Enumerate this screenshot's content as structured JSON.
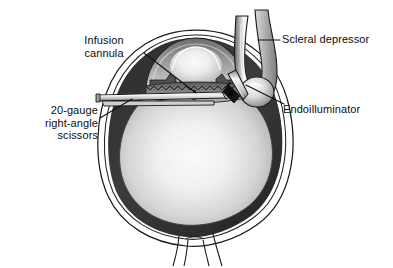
{
  "figure": {
    "background_color": "#ffffff",
    "ink_color": "#111111",
    "dark_tissue_color": "#3a3a3a",
    "mid_tissue_color": "#8d8d8d",
    "light_tissue_color": "#f2f2f2",
    "sclera_color": "#ffffff",
    "leader_line_color": "#111111"
  },
  "labels": [
    {
      "id": "infusion-cannula",
      "lines": "Infusion\ncannula",
      "align": "center",
      "anchor_side": "top-left"
    },
    {
      "id": "scissors",
      "lines": "20-gauge\nright-angle\nscissors",
      "align": "right",
      "anchor_side": "left"
    },
    {
      "id": "scleral-depressor",
      "lines": "Scleral depressor",
      "align": "left",
      "anchor_side": "top-right"
    },
    {
      "id": "endoilluminator",
      "lines": "Endoilluminator",
      "align": "left",
      "anchor_side": "right"
    }
  ],
  "anatomy": [
    {
      "id": "sclera",
      "name": "Sclera"
    },
    {
      "id": "choroid-retina",
      "name": "Choroid and retina"
    },
    {
      "id": "vitreous-cavity",
      "name": "Vitreous cavity"
    },
    {
      "id": "cornea",
      "name": "Cornea"
    },
    {
      "id": "lens",
      "name": "Crystalline lens"
    },
    {
      "id": "iris",
      "name": "Iris"
    },
    {
      "id": "ciliary-body",
      "name": "Ciliary body"
    },
    {
      "id": "optic-nerve",
      "name": "Optic nerve"
    }
  ],
  "instruments": [
    {
      "id": "infusion-cannula",
      "name": "Infusion cannula"
    },
    {
      "id": "scissors",
      "name": "20-gauge right-angle scissors"
    },
    {
      "id": "scleral-depressor",
      "name": "Scleral depressor"
    },
    {
      "id": "endoilluminator",
      "name": "Endoilluminator"
    }
  ]
}
